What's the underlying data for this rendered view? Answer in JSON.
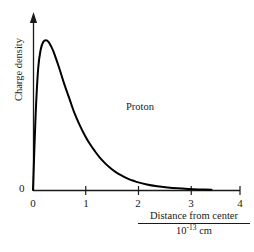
{
  "chart_data": {
    "type": "line",
    "title": "",
    "xlabel": "Distance from center",
    "xlabel_denominator": "10^-13 cm",
    "xlabel_denominator_mantissa": "10",
    "xlabel_denominator_exponent": "-13",
    "xlabel_denominator_unit": " cm",
    "ylabel": "Charge density",
    "xlim": [
      0,
      4
    ],
    "ylim": [
      0,
      1.08
    ],
    "xticks": [
      0,
      1,
      2,
      3,
      4
    ],
    "xticklabels": [
      "0",
      "1",
      "2",
      "3",
      "4"
    ],
    "yticks": [
      0
    ],
    "yticklabels": [
      "0"
    ],
    "grid": false,
    "legend": null,
    "annotations": [
      {
        "text": "Proton",
        "x": 1.8,
        "y": 0.62
      }
    ],
    "series": [
      {
        "name": "Proton charge density",
        "color": "#000000",
        "linewidth": 2,
        "x": [
          0.0,
          0.05,
          0.1,
          0.15,
          0.2,
          0.25,
          0.3,
          0.35,
          0.4,
          0.5,
          0.6,
          0.7,
          0.8,
          0.9,
          1.0,
          1.1,
          1.2,
          1.3,
          1.4,
          1.5,
          1.6,
          1.7,
          1.8,
          1.9,
          2.0,
          2.2,
          2.4,
          2.6,
          2.8,
          3.0,
          3.2,
          3.45
        ],
        "y": [
          0.0,
          0.5,
          0.82,
          0.95,
          1.0,
          1.01,
          1.0,
          0.97,
          0.93,
          0.83,
          0.72,
          0.62,
          0.52,
          0.44,
          0.37,
          0.31,
          0.26,
          0.215,
          0.178,
          0.147,
          0.121,
          0.1,
          0.082,
          0.067,
          0.055,
          0.037,
          0.025,
          0.017,
          0.011,
          0.007,
          0.004,
          0.002
        ]
      }
    ]
  },
  "axes": {
    "y_axis_arrow": true,
    "x_axis_arrow": false,
    "axis_color": "#1a1a1a"
  }
}
